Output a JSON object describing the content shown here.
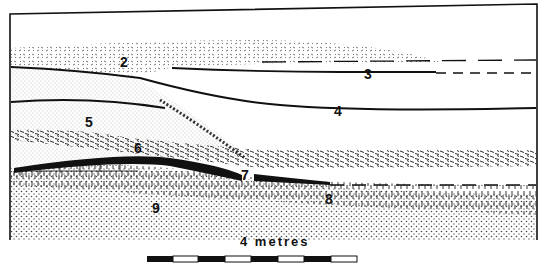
{
  "diagram": {
    "type": "geological cross-section",
    "colors": {
      "ink": "#111111",
      "paper": "#ffffff"
    },
    "layers": [
      {
        "id": "2",
        "label": "2",
        "pattern": "dashed-speckle (wind-blown sand)"
      },
      {
        "id": "3",
        "label": "3",
        "pattern": "line horizon, dashed to right"
      },
      {
        "id": "4",
        "label": "4",
        "pattern": "solid line horizon"
      },
      {
        "id": "5",
        "label": "5",
        "pattern": "fine stipple"
      },
      {
        "id": "6",
        "label": "6",
        "pattern": "dense dash lenses"
      },
      {
        "id": "7",
        "label": "7",
        "pattern": "thick black band"
      },
      {
        "id": "8",
        "label": "8",
        "pattern": "vertical dashes, dashed upper boundary right"
      },
      {
        "id": "9",
        "label": "9",
        "pattern": "coarse dots"
      }
    ],
    "scale_bar": {
      "label": "4 metres",
      "segments": 8,
      "pattern": [
        "black",
        "white",
        "black",
        "white",
        "black",
        "white",
        "black",
        "white"
      ]
    }
  }
}
